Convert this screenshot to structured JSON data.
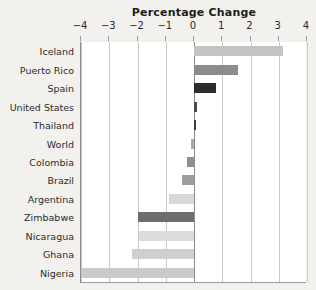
{
  "chart_data": {
    "type": "bar",
    "orientation": "horizontal",
    "title": "Percentage Change",
    "xlabel": "",
    "ylabel": "",
    "xlim": [
      -4,
      4
    ],
    "xticks": [
      -4,
      -3,
      -2,
      -1,
      0,
      1,
      2,
      3,
      4
    ],
    "xticklabels": [
      "−4",
      "−3",
      "−2",
      "−1",
      "0",
      "1",
      "2",
      "3",
      "4"
    ],
    "grid": true,
    "grid_axis": "x",
    "legend": "none",
    "axis_position": "top",
    "categories": [
      "Iceland",
      "Puerto Rico",
      "Spain",
      "United States",
      "Thailand",
      "World",
      "Colombia",
      "Brazil",
      "Argentina",
      "Zimbabwe",
      "Nicaragua",
      "Ghana",
      "Nigeria"
    ],
    "values": [
      3.15,
      1.55,
      0.79,
      0.11,
      0.08,
      -0.11,
      -0.26,
      -0.42,
      -0.87,
      -2.0,
      -1.95,
      -2.2,
      -4.0
    ],
    "bar_colors": [
      "#c4c4c4",
      "#8c8c8c",
      "#2b2b2b",
      "#4a4a4a",
      "#3a3a3a",
      "#a8a8a8",
      "#8f8f8f",
      "#9d9d9d",
      "#d8d8d8",
      "#6e6e6e",
      "#dcdcdc",
      "#cfcfcf",
      "#c9c9c9"
    ]
  },
  "colors": {
    "page_background": "#f2f1ee",
    "plot_background": "#ffffff",
    "gridline": "#c9c9c9",
    "zero_line": "#8c8c8c",
    "text": "#2b2b2b",
    "title_text": "#1d1d1d"
  }
}
